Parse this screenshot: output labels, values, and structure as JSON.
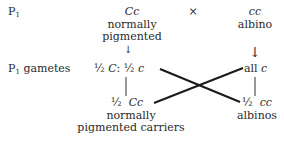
{
  "rows": {
    "p1_label": "P",
    "p1_sub": "1",
    "gametes_label_sub": "1",
    "gametes_label": "gametes"
  },
  "parents": {
    "left": {
      "genotype": "Cc",
      "phenotype_line1": "normally",
      "phenotype_line2": "pigmented"
    },
    "cross_symbol": "×",
    "right": {
      "genotype": "cc",
      "phenotype_line1": "albino"
    }
  },
  "gametes": {
    "left_frac1": "½",
    "left_allele1": "C",
    "left_sep": ":",
    "left_frac2": "½",
    "left_allele2": "c",
    "right_prefix": "all",
    "right_allele": "c"
  },
  "offspring": {
    "left": {
      "fraction": "½",
      "genotype": "Cc",
      "phenotype_line1": "normally",
      "phenotype_line2": "pigmented carriers"
    },
    "right": {
      "fraction": "½",
      "genotype": "cc",
      "phenotype_line1": "albinos"
    }
  },
  "arrows": {
    "down": "↓"
  },
  "colors": {
    "text": "#2a2a2a",
    "lines": "#1a1a1a"
  }
}
